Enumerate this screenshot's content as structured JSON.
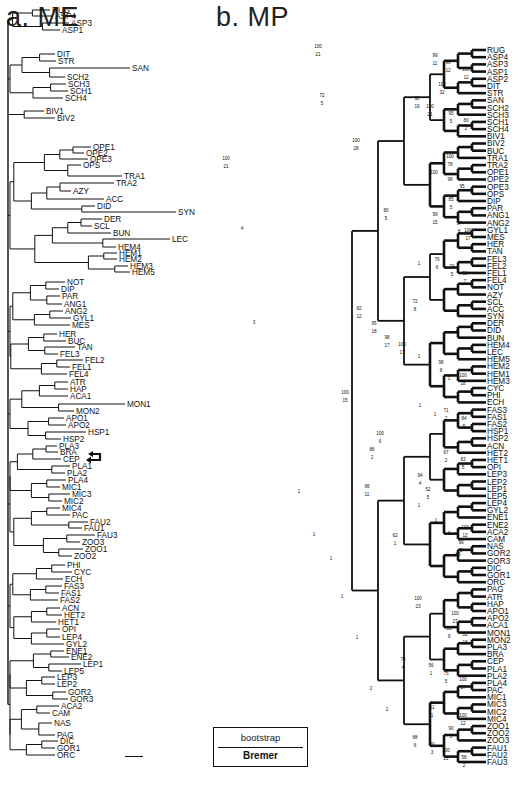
{
  "figure": {
    "panel_a_title": "a. ME",
    "panel_b_title": "b. MP",
    "legend": {
      "top_label": "bootstrap",
      "bottom_label": "Bremer"
    },
    "highlight_arrows_target": [
      "CEP",
      "PLA1"
    ]
  },
  "me_tree": {
    "label": "Minimum Evolution tree",
    "leaves": [
      {
        "n": "RUG",
        "x": 50,
        "y": 10
      },
      {
        "n": "ASP4",
        "x": 53,
        "y": 16
      },
      {
        "n": "ASP3",
        "x": 69,
        "y": 23
      },
      {
        "n": "ASP1",
        "x": 60,
        "y": 30
      },
      {
        "n": "DIT",
        "x": 55,
        "y": 54
      },
      {
        "n": "STR",
        "x": 56,
        "y": 61
      },
      {
        "n": "SAN",
        "x": 130,
        "y": 68
      },
      {
        "n": "SCH2",
        "x": 65,
        "y": 77
      },
      {
        "n": "SCH3",
        "x": 66,
        "y": 84
      },
      {
        "n": "SCH1",
        "x": 68,
        "y": 91
      },
      {
        "n": "SCH4",
        "x": 63,
        "y": 98
      },
      {
        "n": "BIV1",
        "x": 44,
        "y": 111
      },
      {
        "n": "BIV2",
        "x": 55,
        "y": 118
      },
      {
        "n": "OPE1",
        "x": 91,
        "y": 147
      },
      {
        "n": "OPE2",
        "x": 84,
        "y": 153
      },
      {
        "n": "OPE3",
        "x": 88,
        "y": 159
      },
      {
        "n": "OPS",
        "x": 81,
        "y": 165
      },
      {
        "n": "TRA1",
        "x": 122,
        "y": 176
      },
      {
        "n": "TRA2",
        "x": 114,
        "y": 183
      },
      {
        "n": "AZY",
        "x": 71,
        "y": 191
      },
      {
        "n": "ACC",
        "x": 104,
        "y": 199
      },
      {
        "n": "DID",
        "x": 95,
        "y": 206
      },
      {
        "n": "SYN",
        "x": 176,
        "y": 212
      },
      {
        "n": "DER",
        "x": 102,
        "y": 219
      },
      {
        "n": "SCL",
        "x": 92,
        "y": 226
      },
      {
        "n": "BUN",
        "x": 111,
        "y": 233
      },
      {
        "n": "LEC",
        "x": 170,
        "y": 239
      },
      {
        "n": "HEM4",
        "x": 116,
        "y": 247
      },
      {
        "n": "HEM1",
        "x": 117,
        "y": 253
      },
      {
        "n": "HEM2",
        "x": 117,
        "y": 259
      },
      {
        "n": "HEM3",
        "x": 128,
        "y": 266
      },
      {
        "n": "HEM5",
        "x": 130,
        "y": 272
      },
      {
        "n": "NOT",
        "x": 65,
        "y": 282
      },
      {
        "n": "DIP",
        "x": 59,
        "y": 289
      },
      {
        "n": "PAR",
        "x": 60,
        "y": 296
      },
      {
        "n": "ANG1",
        "x": 62,
        "y": 304
      },
      {
        "n": "ANG2",
        "x": 63,
        "y": 311
      },
      {
        "n": "GYL1",
        "x": 71,
        "y": 318
      },
      {
        "n": "MES",
        "x": 70,
        "y": 325
      },
      {
        "n": "HER",
        "x": 57,
        "y": 334
      },
      {
        "n": "BUC",
        "x": 66,
        "y": 341
      },
      {
        "n": "TAN",
        "x": 75,
        "y": 347
      },
      {
        "n": "FEL3",
        "x": 58,
        "y": 354
      },
      {
        "n": "FEL2",
        "x": 83,
        "y": 360
      },
      {
        "n": "FEL1",
        "x": 70,
        "y": 367
      },
      {
        "n": "FEL4",
        "x": 67,
        "y": 374
      },
      {
        "n": "ATR",
        "x": 68,
        "y": 382
      },
      {
        "n": "HAP",
        "x": 68,
        "y": 389
      },
      {
        "n": "ACA1",
        "x": 68,
        "y": 396
      },
      {
        "n": "MON1",
        "x": 125,
        "y": 404
      },
      {
        "n": "MON2",
        "x": 74,
        "y": 411
      },
      {
        "n": "APO1",
        "x": 64,
        "y": 418
      },
      {
        "n": "APO2",
        "x": 66,
        "y": 425
      },
      {
        "n": "HSP1",
        "x": 86,
        "y": 432
      },
      {
        "n": "HSP2",
        "x": 61,
        "y": 439
      },
      {
        "n": "PLA3",
        "x": 57,
        "y": 446
      },
      {
        "n": "BRA",
        "x": 58,
        "y": 452
      },
      {
        "n": "CEP",
        "x": 61,
        "y": 459
      },
      {
        "n": "PLA1",
        "x": 70,
        "y": 466
      },
      {
        "n": "PLA2",
        "x": 65,
        "y": 473
      },
      {
        "n": "PLA4",
        "x": 66,
        "y": 480
      },
      {
        "n": "MIC1",
        "x": 60,
        "y": 487
      },
      {
        "n": "MIC3",
        "x": 70,
        "y": 494
      },
      {
        "n": "MIC2",
        "x": 62,
        "y": 501
      },
      {
        "n": "MIC4",
        "x": 60,
        "y": 508
      },
      {
        "n": "PAC",
        "x": 70,
        "y": 515
      },
      {
        "n": "FAU2",
        "x": 88,
        "y": 522
      },
      {
        "n": "FAU1",
        "x": 82,
        "y": 528
      },
      {
        "n": "FAU3",
        "x": 95,
        "y": 535
      },
      {
        "n": "ZOO3",
        "x": 80,
        "y": 542
      },
      {
        "n": "ZOO1",
        "x": 83,
        "y": 549
      },
      {
        "n": "ZOO2",
        "x": 72,
        "y": 556
      },
      {
        "n": "PHI",
        "x": 65,
        "y": 565
      },
      {
        "n": "CYC",
        "x": 72,
        "y": 572
      },
      {
        "n": "ECH",
        "x": 63,
        "y": 579
      },
      {
        "n": "FAS3",
        "x": 62,
        "y": 586
      },
      {
        "n": "FAS1",
        "x": 59,
        "y": 593
      },
      {
        "n": "FAS2",
        "x": 58,
        "y": 600
      },
      {
        "n": "ACN",
        "x": 60,
        "y": 608
      },
      {
        "n": "HET2",
        "x": 62,
        "y": 615
      },
      {
        "n": "HET1",
        "x": 56,
        "y": 622
      },
      {
        "n": "OPI",
        "x": 60,
        "y": 629
      },
      {
        "n": "LEP4",
        "x": 60,
        "y": 637
      },
      {
        "n": "GYL2",
        "x": 64,
        "y": 644
      },
      {
        "n": "ENE1",
        "x": 64,
        "y": 651
      },
      {
        "n": "ENE2",
        "x": 69,
        "y": 657
      },
      {
        "n": "LEP1",
        "x": 81,
        "y": 664
      },
      {
        "n": "LEP5",
        "x": 62,
        "y": 671
      },
      {
        "n": "LEP3",
        "x": 55,
        "y": 677
      },
      {
        "n": "LEP2",
        "x": 55,
        "y": 684
      },
      {
        "n": "GOR2",
        "x": 66,
        "y": 692
      },
      {
        "n": "GOR3",
        "x": 68,
        "y": 699
      },
      {
        "n": "ACA2",
        "x": 59,
        "y": 706
      },
      {
        "n": "CAM",
        "x": 50,
        "y": 713
      },
      {
        "n": "NAS",
        "x": 52,
        "y": 723
      },
      {
        "n": "PAG",
        "x": 55,
        "y": 735
      },
      {
        "n": "DIC",
        "x": 58,
        "y": 741
      },
      {
        "n": "GOR1",
        "x": 55,
        "y": 748
      },
      {
        "n": "ORC",
        "x": 55,
        "y": 755
      }
    ]
  },
  "mp_tree": {
    "label": "Maximum Parsimony strict consensus",
    "leaf_x": 486,
    "leaves": [
      "RUG",
      "ASP4",
      "ASP3",
      "ASP1",
      "ASP2",
      "DIT",
      "STR",
      "SAN",
      "SCH2",
      "SCH3",
      "SCH1",
      "SCH4",
      "BIV1",
      "BIV2",
      "BUC",
      "TRA1",
      "TRA2",
      "OPE1",
      "OPE2",
      "OPE3",
      "OPS",
      "DIP",
      "PAR",
      "ANG1",
      "ANG2",
      "GYL1",
      "MES",
      "HER",
      "TAN",
      "FEL3",
      "FEL2",
      "FEL1",
      "FEL4",
      "NOT",
      "AZY",
      "SCL",
      "ACC",
      "SYN",
      "DER",
      "DID",
      "BUN",
      "HEM4",
      "LEC",
      "HEM5",
      "HEM2",
      "HEM1",
      "HEM3",
      "CYC",
      "PHI",
      "ECH",
      "FAS3",
      "FAS1",
      "FAS2",
      "HSP1",
      "HSP2",
      "ACN",
      "HET2",
      "HET1",
      "OPI",
      "LEP3",
      "LEP2",
      "LEP1",
      "LEP5",
      "LEP4",
      "GYL2",
      "ENE1",
      "ENE2",
      "ACA2",
      "CAM",
      "NAS",
      "GOR2",
      "GOR3",
      "DIC",
      "GOR1",
      "ORC",
      "PAG",
      "ATR",
      "HAP",
      "APO1",
      "APO2",
      "ACA1",
      "MON1",
      "MON2",
      "PLA3",
      "BRA",
      "CEP",
      "PLA1",
      "PLA2",
      "PLA4",
      "PAC",
      "MIC1",
      "MIC3",
      "MIC2",
      "MIC4",
      "ZOO1",
      "ZOO2",
      "ZOO3",
      "FAU1",
      "FAU2",
      "FAU3"
    ],
    "support_labels": [
      {
        "boot": "100",
        "bremer": "21",
        "x": 318,
        "y": 50
      },
      {
        "boot": "99",
        "bremer": "11",
        "x": 435,
        "y": 59
      },
      {
        "boot": "99",
        "bremer": "12",
        "x": 448,
        "y": 66
      },
      {
        "boot": "100",
        "bremer": "12",
        "x": 466,
        "y": 73
      },
      {
        "boot": "72",
        "bremer": "5",
        "x": 322,
        "y": 99
      },
      {
        "boot": "100",
        "bremer": "32",
        "x": 442,
        "y": 88
      },
      {
        "boot": "90",
        "bremer": "19",
        "x": 417,
        "y": 102
      },
      {
        "boot": "100",
        "bremer": "21",
        "x": 430,
        "y": 110
      },
      {
        "boot": "95",
        "bremer": "5",
        "x": 451,
        "y": 117
      },
      {
        "boot": "80",
        "bremer": "2",
        "x": 466,
        "y": 124
      },
      {
        "boot": "100",
        "bremer": "21",
        "x": 226,
        "y": 162
      },
      {
        "boot": "4",
        "bremer": "",
        "x": 242,
        "y": 232
      },
      {
        "boot": "100",
        "bremer": "28",
        "x": 356,
        "y": 144
      },
      {
        "boot": "100",
        "bremer": "78",
        "x": 450,
        "y": 160
      },
      {
        "boot": "100",
        "bremer": "",
        "x": 434,
        "y": 176
      },
      {
        "boot": "98",
        "bremer": "",
        "x": 450,
        "y": 183
      },
      {
        "boot": "95",
        "bremer": "",
        "x": 462,
        "y": 190
      },
      {
        "boot": "85",
        "bremer": "5",
        "x": 451,
        "y": 203
      },
      {
        "boot": "80",
        "bremer": "5",
        "x": 386,
        "y": 214
      },
      {
        "boot": "99",
        "bremer": "15",
        "x": 435,
        "y": 218
      },
      {
        "boot": "97",
        "bremer": "8",
        "x": 459,
        "y": 227
      },
      {
        "boot": "100",
        "bremer": "17",
        "x": 468,
        "y": 234
      },
      {
        "boot": "3",
        "bremer": "",
        "x": 254,
        "y": 326
      },
      {
        "boot": "1",
        "bremer": "",
        "x": 419,
        "y": 267
      },
      {
        "boot": "76",
        "bremer": "6",
        "x": 437,
        "y": 263
      },
      {
        "boot": "74",
        "bremer": "5",
        "x": 452,
        "y": 270
      },
      {
        "boot": "98",
        "bremer": "7",
        "x": 465,
        "y": 277
      },
      {
        "boot": "72",
        "bremer": "8",
        "x": 415,
        "y": 305
      },
      {
        "boot": "3",
        "bremer": "",
        "x": 458,
        "y": 319
      },
      {
        "boot": "2",
        "bremer": "",
        "x": 457,
        "y": 333
      },
      {
        "boot": "82",
        "bremer": "12",
        "x": 359,
        "y": 312
      },
      {
        "boot": "95",
        "bremer": "18",
        "x": 374,
        "y": 327
      },
      {
        "boot": "98",
        "bremer": "17",
        "x": 387,
        "y": 341
      },
      {
        "boot": "100",
        "bremer": "17",
        "x": 402,
        "y": 348
      },
      {
        "boot": "1",
        "bremer": "",
        "x": 419,
        "y": 360
      },
      {
        "boot": "98",
        "bremer": "8",
        "x": 441,
        "y": 366
      },
      {
        "boot": "1",
        "bremer": "",
        "x": 449,
        "y": 382
      },
      {
        "boot": "100",
        "bremer": "18",
        "x": 463,
        "y": 379
      },
      {
        "boot": "100",
        "bremer": "15",
        "x": 345,
        "y": 396
      },
      {
        "boot": "1",
        "bremer": "",
        "x": 420,
        "y": 409
      },
      {
        "boot": "1",
        "bremer": "",
        "x": 435,
        "y": 418
      },
      {
        "boot": "71",
        "bremer": "2",
        "x": 446,
        "y": 414
      },
      {
        "boot": "84",
        "bremer": "5",
        "x": 464,
        "y": 422
      },
      {
        "boot": "100",
        "bremer": "6",
        "x": 380,
        "y": 437
      },
      {
        "boot": "86",
        "bremer": "2",
        "x": 372,
        "y": 453
      },
      {
        "boot": "67",
        "bremer": "2",
        "x": 446,
        "y": 456
      },
      {
        "boot": "83",
        "bremer": "5",
        "x": 463,
        "y": 463
      },
      {
        "boot": "1",
        "bremer": "",
        "x": 299,
        "y": 495
      },
      {
        "boot": "96",
        "bremer": "11",
        "x": 367,
        "y": 490
      },
      {
        "boot": "1",
        "bremer": "",
        "x": 314,
        "y": 538
      },
      {
        "boot": "94",
        "bremer": "4",
        "x": 420,
        "y": 479
      },
      {
        "boot": "52",
        "bremer": "5",
        "x": 428,
        "y": 493
      },
      {
        "boot": "1",
        "bremer": "",
        "x": 419,
        "y": 509
      },
      {
        "boot": "1",
        "bremer": "",
        "x": 436,
        "y": 524
      },
      {
        "boot": "3",
        "bremer": "",
        "x": 449,
        "y": 537
      },
      {
        "boot": "100",
        "bremer": "12",
        "x": 465,
        "y": 531
      },
      {
        "boot": "62",
        "bremer": "1",
        "x": 395,
        "y": 539
      },
      {
        "boot": "99",
        "bremer": "5",
        "x": 461,
        "y": 546
      },
      {
        "boot": "1",
        "bremer": "",
        "x": 331,
        "y": 562
      },
      {
        "boot": "85",
        "bremer": "",
        "x": 458,
        "y": 558
      },
      {
        "boot": "1",
        "bremer": "",
        "x": 342,
        "y": 600
      },
      {
        "boot": "1",
        "bremer": "",
        "x": 357,
        "y": 641
      },
      {
        "boot": "100",
        "bremer": "23",
        "x": 418,
        "y": 602
      },
      {
        "boot": "100",
        "bremer": "27",
        "x": 455,
        "y": 617
      },
      {
        "boot": "85",
        "bremer": "9",
        "x": 449,
        "y": 632
      },
      {
        "boot": "82",
        "bremer": "18",
        "x": 465,
        "y": 638
      },
      {
        "boot": "74",
        "bremer": "4",
        "x": 403,
        "y": 663
      },
      {
        "boot": "2",
        "bremer": "",
        "x": 371,
        "y": 692
      },
      {
        "boot": "2",
        "bremer": "",
        "x": 387,
        "y": 713
      },
      {
        "boot": "56",
        "bremer": "1",
        "x": 431,
        "y": 669
      },
      {
        "boot": "75",
        "bremer": "5",
        "x": 446,
        "y": 677
      },
      {
        "boot": "100",
        "bremer": "17",
        "x": 463,
        "y": 683
      },
      {
        "boot": "61",
        "bremer": "1",
        "x": 432,
        "y": 711
      },
      {
        "boot": "100",
        "bremer": "12",
        "x": 463,
        "y": 719
      },
      {
        "boot": "90",
        "bremer": "5",
        "x": 451,
        "y": 732
      },
      {
        "boot": "88",
        "bremer": "6",
        "x": 415,
        "y": 741
      },
      {
        "boot": "80",
        "bremer": "3",
        "x": 432,
        "y": 748
      },
      {
        "boot": "100",
        "bremer": "21",
        "x": 446,
        "y": 754
      },
      {
        "boot": "58",
        "bremer": "2",
        "x": 464,
        "y": 761
      }
    ]
  }
}
